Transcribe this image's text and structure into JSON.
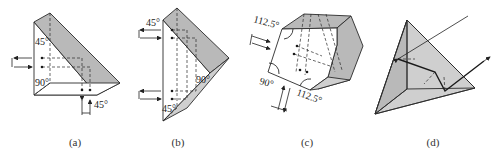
{
  "figure": {
    "panels": [
      {
        "id": "a",
        "caption": "(a)",
        "description": "Right-angle prism with 90° roof",
        "angle_labels": [
          "45°",
          "90°",
          "45°"
        ]
      },
      {
        "id": "b",
        "caption": "(b)",
        "description": "Roof (Dove-type) right-angle prism",
        "angle_labels": [
          "45°",
          "90°",
          "45°"
        ]
      },
      {
        "id": "c",
        "caption": "(c)",
        "description": "Pentaprism with roof",
        "angle_labels": [
          "112.5°",
          "90°",
          "112.5°"
        ]
      },
      {
        "id": "d",
        "caption": "(d)",
        "description": "Corner-cube (trihedral) retroreflector",
        "angle_labels": []
      }
    ],
    "colors": {
      "line": "#2a2a2a",
      "shade": "#b9b9b9",
      "background": "#ffffff"
    }
  }
}
